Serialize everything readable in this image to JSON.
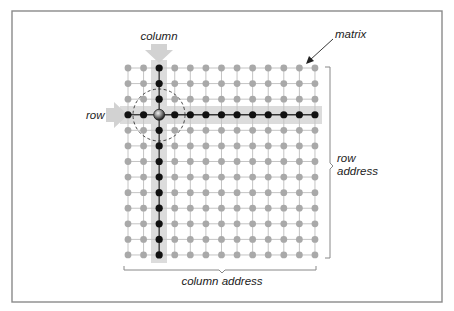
{
  "diagram": {
    "labels": {
      "column": "column",
      "row": "row",
      "matrix": "matrix",
      "row_address_line1": "row",
      "row_address_line2": "address",
      "column_address": "column address"
    },
    "grid": {
      "rows": 13,
      "cols": 13,
      "selected_row": 3,
      "selected_col": 2
    },
    "colors": {
      "frame": "#8a8a8a",
      "grid_line": "#c4c4c4",
      "inactive_dot": "#a9a9a9",
      "active_dot": "#111111",
      "highlight_band": "#dcdcdc",
      "arrow_fill": "#d2d2d2",
      "text": "#222222"
    }
  }
}
